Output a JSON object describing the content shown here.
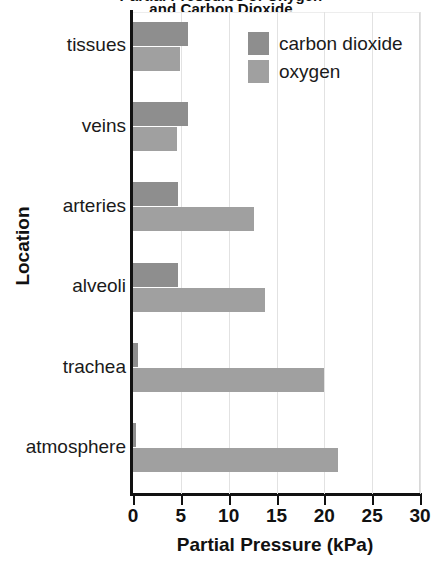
{
  "chart_data": {
    "type": "bar",
    "orientation": "horizontal",
    "title": "Partial Pressures of Oxygen and Carbon Dioxide",
    "title_line1": "Partial Pressures of Oxygen",
    "title_line2": "and Carbon Dioxide",
    "xlabel": "Partial Pressure (kPa)",
    "ylabel": "Location",
    "categories": [
      "tissues",
      "veins",
      "arteries",
      "alveoli",
      "trachea",
      "atmosphere"
    ],
    "series": [
      {
        "name": "carbon dioxide",
        "color": "#8e8e8e",
        "values": [
          5.8,
          5.8,
          4.7,
          4.7,
          0.5,
          0.3
        ]
      },
      {
        "name": "oxygen",
        "color": "#a0a0a0",
        "values": [
          4.9,
          4.6,
          12.6,
          13.8,
          20.0,
          21.4
        ]
      }
    ],
    "xlim": [
      0,
      30
    ],
    "xticks": [
      0,
      5,
      10,
      15,
      20,
      25,
      30
    ],
    "xtick_labels": [
      "0",
      "5",
      "10",
      "15",
      "20",
      "25",
      "30"
    ],
    "grid": "vertical",
    "legend_position": "top-right",
    "legend_entries": [
      "carbon dioxide",
      "oxygen"
    ]
  }
}
